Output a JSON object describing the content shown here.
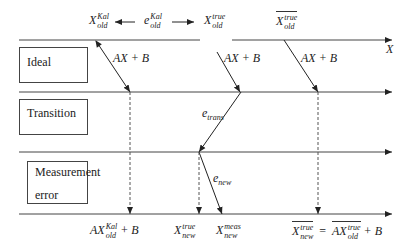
{
  "diagram": {
    "colors": {
      "line": "#333333",
      "dashed": "#555555",
      "text": "#222222",
      "background": "#ffffff"
    },
    "axis_label": "X",
    "boxes": {
      "ideal": "Ideal",
      "transition": "Transition",
      "measurement_line1": "Measurement",
      "measurement_line2": "error"
    },
    "top_labels": {
      "x_old_kal": {
        "base": "X",
        "sup": "Kal",
        "sub": "old"
      },
      "e_old_kal": {
        "base": "e",
        "sup": "Kal",
        "sub": "old"
      },
      "x_old_true": {
        "base": "X",
        "sup": "true",
        "sub": "old"
      },
      "x_old_true_bar": {
        "base": "X",
        "sup": "true",
        "sub": "old"
      }
    },
    "arrow_labels": {
      "ax_b_1": "AX + B",
      "ax_b_2": "AX + B",
      "ax_b_3": "AX + B",
      "e_trans": {
        "base": "e",
        "sub": "trans"
      },
      "e_new": {
        "base": "e",
        "sub": "new"
      }
    },
    "bottom_labels": {
      "ax_old_kal_b": {
        "prefix": "AX",
        "sup": "Kal",
        "sub": "old",
        "suffix": "+ B"
      },
      "x_new_true": {
        "base": "X",
        "sup": "true",
        "sub": "new"
      },
      "x_new_meas": {
        "base": "X",
        "sup": "meas",
        "sub": "new"
      },
      "equation": {
        "lhs_base": "X",
        "lhs_sup": "true",
        "lhs_sub": "new",
        "eq": "=",
        "rhs_prefix": "AX",
        "rhs_sup": "true",
        "rhs_sub": "old",
        "rhs_suffix": "+ B"
      }
    }
  }
}
